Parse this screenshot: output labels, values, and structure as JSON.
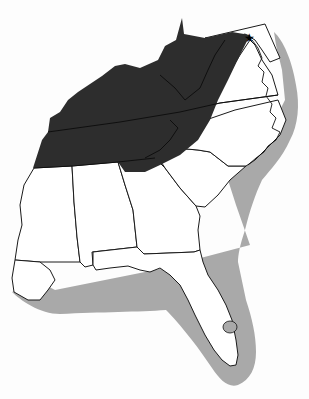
{
  "map": {
    "title": "",
    "region": "Southeastern United States",
    "colors": {
      "background": "#fdfdfd",
      "state_fill": "#ffffff",
      "highlight_region": "#2d2d2d",
      "coastal_buffer": "#a9a9a9",
      "border": "#111111"
    },
    "layers": [
      {
        "id": "coastal-buffer",
        "label": "Coastal zone (light grey)"
      },
      {
        "id": "highlight-region",
        "label": "Interior highland region (dark)"
      },
      {
        "id": "state-borders",
        "label": "State borders"
      }
    ],
    "marker": {
      "icon": "star-icon",
      "x": 249,
      "y": 38
    }
  }
}
